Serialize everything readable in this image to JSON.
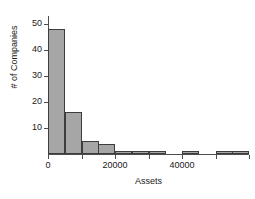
{
  "chart_data": {
    "type": "bar",
    "title": "",
    "xlabel": "Assets",
    "ylabel": "# of Companies",
    "bin_width": 5000,
    "bin_starts": [
      0,
      5000,
      10000,
      15000,
      20000,
      25000,
      30000,
      35000,
      40000,
      45000,
      50000,
      55000
    ],
    "categories": [
      "0-5000",
      "5000-10000",
      "10000-15000",
      "15000-20000",
      "20000-25000",
      "25000-30000",
      "30000-35000",
      "35000-40000",
      "40000-45000",
      "45000-50000",
      "50000-55000",
      "55000-60000"
    ],
    "values": [
      48,
      16,
      5,
      4,
      1,
      1,
      1,
      0,
      1,
      0,
      1,
      1
    ],
    "xlim": [
      0,
      60000
    ],
    "ylim": [
      0,
      53
    ],
    "xticks": [
      0,
      20000,
      40000
    ],
    "xtick_labels": [
      "0",
      "20000",
      "40000"
    ],
    "yticks": [
      10,
      20,
      30,
      40,
      50
    ],
    "ytick_labels": [
      "10",
      "20",
      "30",
      "40",
      "50"
    ],
    "grid": false,
    "legend": false,
    "bar_fill_color": "#a6a6a6",
    "bar_edge_color": "#3d3d3d",
    "axis_color": "#4d4d4d"
  }
}
